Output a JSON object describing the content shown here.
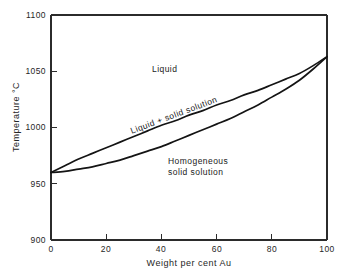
{
  "chart_data": {
    "type": "line",
    "title": "",
    "subtitle": "",
    "xlabel": "Weight per cent Au",
    "ylabel": "Temperature °C",
    "xlim": [
      0,
      100
    ],
    "ylim": [
      900,
      1100
    ],
    "xticks": [
      0,
      20,
      40,
      60,
      80,
      100
    ],
    "xtick_labels": [
      "0",
      "20",
      "40",
      "60",
      "80",
      "100"
    ],
    "yticks": [
      900,
      950,
      1000,
      1050,
      1100
    ],
    "ytick_labels": [
      "900",
      "950",
      "1000",
      "1050",
      "1100"
    ],
    "grid": false,
    "legend": "none",
    "series": [
      {
        "name": "liquidus",
        "x": [
          0,
          5,
          10,
          15,
          20,
          25,
          30,
          35,
          40,
          45,
          50,
          55,
          60,
          65,
          70,
          75,
          80,
          85,
          90,
          95,
          100
        ],
        "values": [
          960,
          966,
          972,
          977,
          982,
          987,
          992,
          997,
          1002,
          1006,
          1011,
          1015,
          1020,
          1024,
          1029,
          1033,
          1038,
          1043,
          1048,
          1055,
          1063
        ]
      },
      {
        "name": "solidus",
        "x": [
          0,
          5,
          10,
          15,
          20,
          25,
          30,
          35,
          40,
          45,
          50,
          55,
          60,
          65,
          70,
          75,
          80,
          85,
          90,
          95,
          100
        ],
        "values": [
          960,
          961,
          963,
          965,
          968,
          971,
          975,
          979,
          983,
          988,
          993,
          998,
          1003,
          1008,
          1014,
          1020,
          1027,
          1034,
          1042,
          1052,
          1063
        ]
      }
    ],
    "annotations": [
      {
        "text": "Liquid",
        "x": 37,
        "y": 1057,
        "rotation": 0
      },
      {
        "text": "Liquid + solid solution",
        "x": 29,
        "y": 1002,
        "rotation": -20.5
      },
      {
        "text": "Homogeneous",
        "x": 42,
        "y": 975,
        "rotation": 0
      },
      {
        "text": "solid solution",
        "x": 42,
        "y": 968,
        "rotation": 0
      }
    ],
    "endpoints": {
      "ag_melting_point": 960,
      "au_melting_point": 1063
    },
    "colors": {
      "background": "#ffffff",
      "axis": "#2b2b2b",
      "curve": "#141414",
      "text": "#1a1a1a"
    }
  },
  "axes": {
    "y_title": "Temperature °C",
    "x_title": "Weight per cent Au",
    "y_tick_labels": [
      "1100",
      "1050",
      "1000",
      "950",
      "900"
    ],
    "x_tick_labels": [
      "0",
      "20",
      "40",
      "60",
      "80",
      "100"
    ]
  },
  "regions": {
    "liquid": "Liquid",
    "two_phase": "Liquid + solid solution",
    "solid_line1": "Homogeneous",
    "solid_line2": "solid solution"
  }
}
